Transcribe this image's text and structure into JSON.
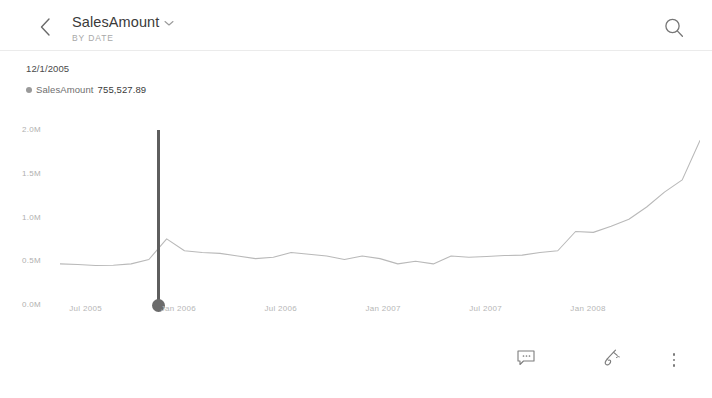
{
  "header": {
    "back_icon": "chevron-left-icon",
    "title": "SalesAmount",
    "title_dropdown_icon": "chevron-down-icon",
    "subtitle": "BY DATE",
    "search_icon": "search-icon"
  },
  "readout": {
    "date": "12/1/2005",
    "series_label": "SalesAmount",
    "value": "755,527.89",
    "marker_color": "#9a9a9a"
  },
  "toolbar": {
    "comment_icon": "comment-bubble-icon",
    "annotate_icon": "annotate-pen-icon",
    "more_icon": "more-vertical-icon"
  },
  "chart_data": {
    "type": "line",
    "title": "SalesAmount",
    "subtitle": "BY DATE",
    "xlabel": "",
    "ylabel": "",
    "ylim": [
      0,
      2000000
    ],
    "yticks": [
      0,
      500000,
      1000000,
      1500000,
      2000000
    ],
    "ytick_labels": [
      "0.0M",
      "0.5M",
      "1.0M",
      "1.5M",
      "2.0M"
    ],
    "xtick_labels": [
      "Jul 2005",
      "Jan 2006",
      "Jul 2006",
      "Jan 2007",
      "Jul 2007",
      "Jan 2008"
    ],
    "xtick_positions": [
      0.04,
      0.185,
      0.345,
      0.505,
      0.665,
      0.825
    ],
    "grid": false,
    "legend": "none",
    "line_color": "#b9b9b9",
    "cursor": {
      "x_fraction": 0.1545,
      "date": "12/1/2005",
      "value": 755527.89,
      "line_color": "#5e5e5e",
      "dot_color": "#6b6b6b"
    },
    "series": [
      {
        "name": "SalesAmount",
        "x": [
          "Jun 2005",
          "Jul 2005",
          "Aug 2005",
          "Sep 2005",
          "Oct 2005",
          "Nov 2005",
          "Dec 2005",
          "Jan 2006",
          "Feb 2006",
          "Mar 2006",
          "Apr 2006",
          "May 2006",
          "Jun 2006",
          "Jul 2006",
          "Aug 2006",
          "Sep 2006",
          "Oct 2006",
          "Nov 2006",
          "Dec 2006",
          "Jan 2007",
          "Feb 2007",
          "Mar 2007",
          "Apr 2007",
          "May 2007",
          "Jun 2007",
          "Jul 2007",
          "Aug 2007",
          "Sep 2007",
          "Oct 2007",
          "Nov 2007",
          "Dec 2007",
          "Jan 2008",
          "Feb 2008",
          "Mar 2008",
          "Apr 2008",
          "May 2008",
          "Jun 2008"
        ],
        "values": [
          470000,
          462000,
          452000,
          455000,
          470000,
          520000,
          755528,
          620000,
          600000,
          590000,
          560000,
          530000,
          545000,
          600000,
          580000,
          560000,
          520000,
          560000,
          530000,
          470000,
          500000,
          470000,
          560000,
          545000,
          555000,
          565000,
          570000,
          600000,
          620000,
          840000,
          830000,
          900000,
          980000,
          1120000,
          1290000,
          1430000,
          1880000
        ]
      }
    ],
    "note": "Line rises from ~0.47M mid-2005 to ~1.95M mid-2008; local peak 1.88M then dip to 1.45M before final climb to ~1.95M"
  }
}
